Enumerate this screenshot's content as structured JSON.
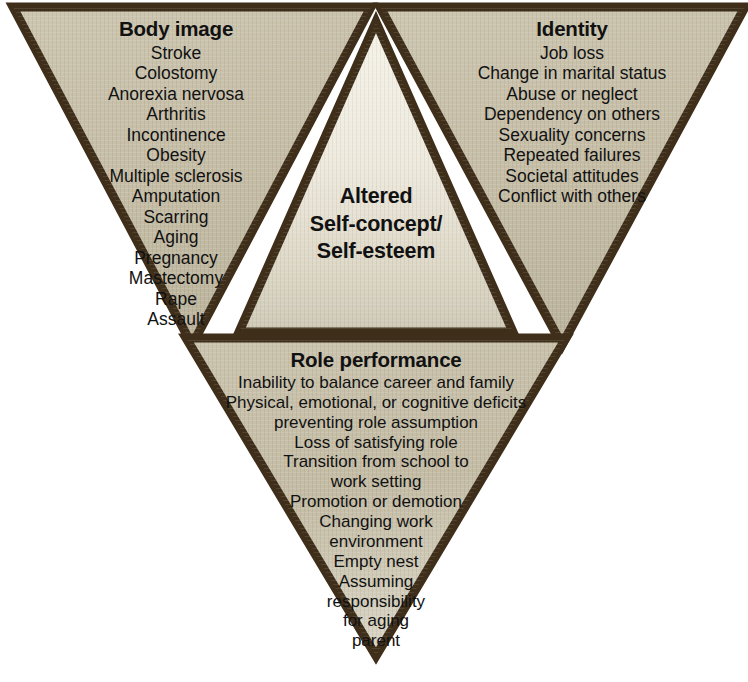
{
  "figure": {
    "colors": {
      "background": "#ffffff",
      "outer_fill": "#c6bfa8",
      "inner_fill": "#efece0",
      "inner_fill_bottom": "#d3cdbc",
      "border": "#3f2f1a",
      "border_light": "#6b5631",
      "text": "#101010"
    }
  },
  "body_image": {
    "heading": "Body image",
    "items": [
      "Stroke",
      "Colostomy",
      "Anorexia nervosa",
      "Arthritis",
      "Incontinence",
      "Obesity",
      "Multiple sclerosis",
      "Amputation",
      "Scarring",
      "Aging",
      "Pregnancy",
      "Mastectomy",
      "Rape",
      "Assault"
    ]
  },
  "identity": {
    "heading": "Identity",
    "items": [
      "Job loss",
      "Change in marital status",
      "Abuse or neglect",
      "Dependency on others",
      "Sexuality concerns",
      "Repeated failures",
      "Societal attitudes",
      "Conflict with others"
    ]
  },
  "center": {
    "line1": "Altered",
    "line2": "Self-concept/",
    "line3": "Self-esteem"
  },
  "role_performance": {
    "heading": "Role performance",
    "items": [
      "Inability to balance career and family",
      "Physical, emotional, or cognitive deficits",
      "preventing role assumption",
      "Loss of satisfying role",
      "Transition from school to",
      "work setting",
      "Promotion or demotion",
      "Changing work",
      "environment",
      "Empty nest",
      "Assuming",
      "responsibility",
      "for aging",
      "parent"
    ]
  }
}
